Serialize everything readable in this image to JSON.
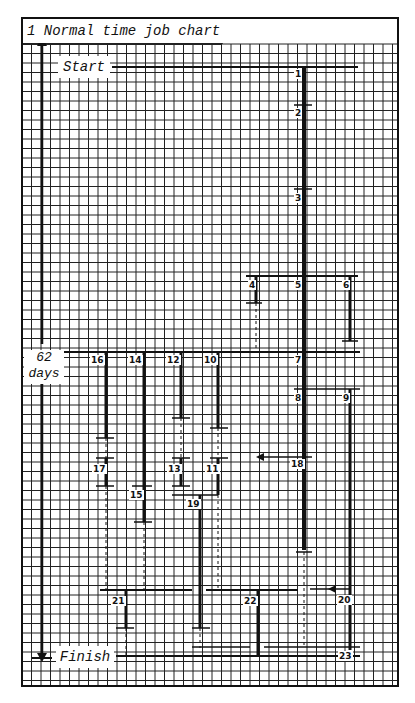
{
  "title": "1  Normal time job chart",
  "start_label": "Start",
  "finish_label": "Finish",
  "duration": {
    "value": "62",
    "unit": "days"
  },
  "colors": {
    "ink": "#111111",
    "grid": "#222222",
    "paper": "#ffffff"
  },
  "grid": {
    "x0": 22,
    "y0": 18,
    "x1": 398,
    "y1": 686,
    "step": 9.5
  },
  "nodes": [
    {
      "id": "1",
      "x": 294,
      "y": 69
    },
    {
      "id": "2",
      "x": 294,
      "y": 108
    },
    {
      "id": "3",
      "x": 294,
      "y": 193
    },
    {
      "id": "4",
      "x": 248,
      "y": 280
    },
    {
      "id": "5",
      "x": 294,
      "y": 280
    },
    {
      "id": "6",
      "x": 342,
      "y": 280
    },
    {
      "id": "7",
      "x": 294,
      "y": 355
    },
    {
      "id": "8",
      "x": 294,
      "y": 393
    },
    {
      "id": "9",
      "x": 342,
      "y": 393
    },
    {
      "id": "10",
      "x": 203,
      "y": 355
    },
    {
      "id": "11",
      "x": 205,
      "y": 464
    },
    {
      "id": "12",
      "x": 166,
      "y": 355
    },
    {
      "id": "13",
      "x": 167,
      "y": 464
    },
    {
      "id": "14",
      "x": 128,
      "y": 355
    },
    {
      "id": "15",
      "x": 129,
      "y": 490
    },
    {
      "id": "16",
      "x": 90,
      "y": 355
    },
    {
      "id": "17",
      "x": 92,
      "y": 464
    },
    {
      "id": "18",
      "x": 290,
      "y": 459
    },
    {
      "id": "19",
      "x": 186,
      "y": 499
    },
    {
      "id": "20",
      "x": 337,
      "y": 595
    },
    {
      "id": "21",
      "x": 111,
      "y": 596
    },
    {
      "id": "22",
      "x": 243,
      "y": 596
    },
    {
      "id": "23",
      "x": 338,
      "y": 651
    }
  ]
}
